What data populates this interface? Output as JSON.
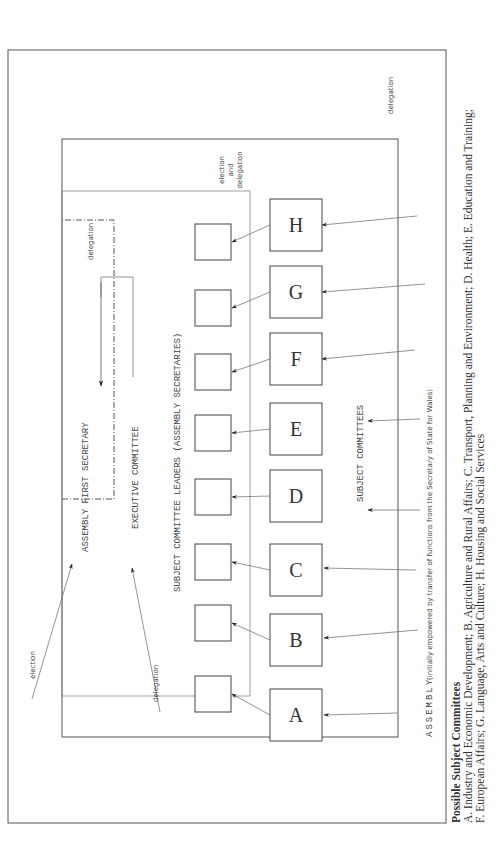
{
  "diagram": {
    "labels": {
      "assembly": "ASSEMBLY",
      "assembly_note": "(initially empowered by transfer of functions from the Secretary of State for Wales)",
      "first_secretary": "ASSEMBLY FIRST SECRETARY",
      "executive_committee": "EXECUTIVE COMMITTEE",
      "leaders": "SUBJECT COMMITTEE LEADERS (ASSEMBLY SECRETARIES)",
      "subject_committees": "SUBJECT COMMITTEES",
      "election": "election",
      "delegation_bottom": "delegation",
      "delegation_top": "delegation",
      "delegation_exec": "delegation",
      "election_and_delegation": [
        "election",
        "and",
        "delegation"
      ]
    },
    "committees": [
      "A",
      "B",
      "C",
      "D",
      "E",
      "F",
      "G",
      "H"
    ]
  },
  "caption": {
    "title": "Possible Subject Committees",
    "line1": "A. Industry and Economic Development; B. Agriculture and Rural Affairs; C. Transport, Planning and Environment; D. Health; E. Education and Training;",
    "line2": "F. European Affairs; G. Language, Arts and Culture; H. Housing and Social Services"
  }
}
